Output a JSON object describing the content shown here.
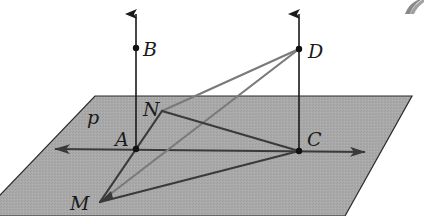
{
  "diagram": {
    "type": "3d-geometry",
    "plane": {
      "label": "p",
      "fill": "#a9a9a9",
      "stroke": "#2a2a2a",
      "points": [
        [
          95,
          96
        ],
        [
          412,
          96
        ],
        [
          345,
          216
        ],
        [
          -20,
          216
        ]
      ]
    },
    "points": {
      "A": {
        "label": "A",
        "x": 136,
        "y": 149,
        "label_x": 115,
        "label_y": 146
      },
      "B": {
        "label": "B",
        "x": 136,
        "y": 48,
        "label_x": 143,
        "label_y": 56
      },
      "C": {
        "label": "C",
        "x": 299,
        "y": 151,
        "label_x": 307,
        "label_y": 146
      },
      "D": {
        "label": "D",
        "x": 299,
        "y": 49,
        "label_x": 308,
        "label_y": 58
      },
      "N": {
        "label": "N",
        "x": 162,
        "y": 111,
        "label_x": 143,
        "label_y": 116
      },
      "M": {
        "label": "M",
        "x": 100,
        "y": 202,
        "label_x": 70,
        "label_y": 210
      }
    },
    "plane_label": {
      "text": "p",
      "x": 87,
      "y": 124
    },
    "line_AC": {
      "x1": 55,
      "y1": 149,
      "x2": 365,
      "y2": 152,
      "color": "#3a3a3a"
    },
    "perpendiculars": [
      {
        "from": "A",
        "x1": 136,
        "y1": 149,
        "x2": 136,
        "y2": 14,
        "color": "#1a1a1a"
      },
      {
        "from": "C",
        "x1": 299,
        "y1": 151,
        "x2": 299,
        "y2": 14,
        "color": "#1a1a1a"
      }
    ],
    "segments": [
      {
        "name": "DN",
        "x1": 299,
        "y1": 49,
        "x2": 162,
        "y2": 111,
        "color": "#7a7a7a"
      },
      {
        "name": "DM",
        "x1": 299,
        "y1": 49,
        "x2": 100,
        "y2": 202,
        "color": "#7a7a7a"
      },
      {
        "name": "NC",
        "x1": 162,
        "y1": 111,
        "x2": 299,
        "y2": 151,
        "color": "#3a3a3a"
      },
      {
        "name": "NM",
        "x1": 162,
        "y1": 111,
        "x2": 100,
        "y2": 202,
        "color": "#3a3a3a"
      },
      {
        "name": "MC",
        "x1": 100,
        "y1": 202,
        "x2": 299,
        "y2": 151,
        "color": "#3a3a3a"
      }
    ],
    "colors": {
      "background": "#ffffff",
      "plane": "#a9a9a9",
      "dark_line": "#1a1a1a",
      "mid_line": "#3a3a3a",
      "light_line": "#7a7a7a"
    }
  }
}
